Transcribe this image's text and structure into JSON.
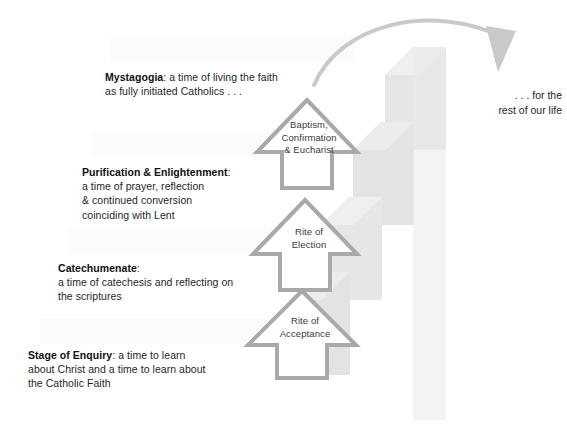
{
  "diagram": {
    "colors": {
      "background": "#ffffff",
      "arrow_outline": "#a9a9a9",
      "shadow_step": "#e3e3e3",
      "shadow_step_light": "#ededed",
      "curve_arrow": "#c9c9c9",
      "text": "#1f1f1f",
      "arrow_label_text": "#3a3a3a"
    },
    "stages": [
      {
        "id": "mystagogia",
        "heading": "Mystagogia",
        "separator": ":",
        "line1": " a time of living the faith",
        "line2": "as fully initiated Catholics . . ."
      },
      {
        "id": "purification",
        "heading": "Purification & Enlightenment",
        "separator": ":",
        "line1": "",
        "line2": "a time of prayer, reflection",
        "line3": "& continued conversion",
        "line4": "coinciding with Lent"
      },
      {
        "id": "catechumenate",
        "heading": "Catechumenate",
        "separator": ":",
        "line1": "",
        "line2": "a time of catechesis and reflecting on",
        "line3": "the scriptures"
      },
      {
        "id": "enquiry",
        "heading": "Stage of Enquiry",
        "separator": ":",
        "line1": " a time to learn",
        "line2": "about Christ and a time to learn about",
        "line3": "the Catholic Faith"
      }
    ],
    "rites": [
      {
        "id": "baptism",
        "line1": "Baptism,",
        "line2": "Confirmation",
        "line3": "& Eucharist"
      },
      {
        "id": "election",
        "line1": "Rite of",
        "line2": "Election",
        "line3": ""
      },
      {
        "id": "acceptance",
        "line1": "Rite of",
        "line2": "Acceptance",
        "line3": ""
      }
    ],
    "closing": {
      "line1": ". . . for the",
      "line2": "rest of our life"
    }
  }
}
